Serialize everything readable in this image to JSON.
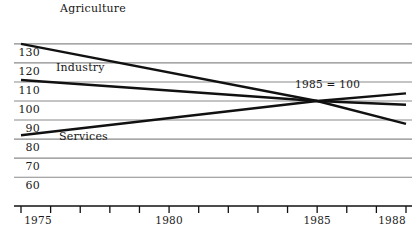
{
  "chart_data": {
    "type": "line",
    "title": "",
    "subtitle": "",
    "xlabel": "",
    "ylabel": "",
    "xlim": [
      1975,
      1988
    ],
    "ylim": [
      60,
      130
    ],
    "grid": true,
    "legend_position": "inline-labels",
    "annotations": [
      {
        "text": "1985 = 100",
        "x": 1985,
        "y": 100
      }
    ],
    "x_ticks": [
      1975,
      1976,
      1977,
      1978,
      1979,
      1980,
      1981,
      1982,
      1983,
      1984,
      1985,
      1986,
      1987,
      1988
    ],
    "x_tick_labels": [
      "1975",
      "",
      "",
      "",
      "",
      "1980",
      "",
      "",
      "",
      "",
      "1985",
      "",
      "",
      "1988"
    ],
    "y_ticks": [
      60,
      70,
      80,
      90,
      100,
      110,
      120,
      130
    ],
    "y_tick_labels": [
      "60",
      "70",
      "80",
      "90",
      "100",
      "110",
      "120",
      "130"
    ],
    "series": [
      {
        "name": "Agriculture",
        "label": "Agriculture",
        "x": [
          1975,
          1985,
          1988
        ],
        "values": [
          130,
          100,
          88
        ]
      },
      {
        "name": "Industry",
        "label": "Industry",
        "x": [
          1975,
          1985,
          1988
        ],
        "values": [
          111,
          100,
          98
        ]
      },
      {
        "name": "Services",
        "label": "Services",
        "x": [
          1975,
          1985,
          1988
        ],
        "values": [
          82,
          100,
          104
        ]
      }
    ]
  },
  "style": {
    "line_color": "#111111",
    "grid_color": "#8a8a8a",
    "axis_color": "#111111",
    "text_color": "#1a1a1a",
    "background": "#ffffff"
  }
}
